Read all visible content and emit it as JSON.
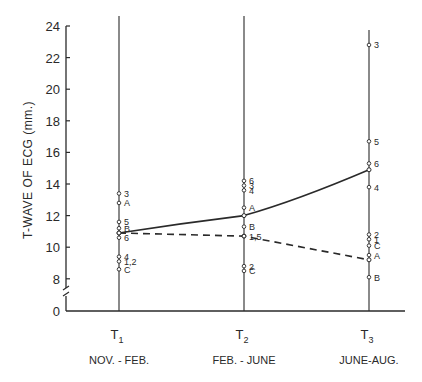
{
  "chart_data": {
    "type": "line",
    "title": "",
    "ylabel": "T-WAVE OF ECG (mm.)",
    "xlabel": "",
    "ylim": [
      0,
      24
    ],
    "y_axis_break": [
      0,
      8
    ],
    "yticks": [
      0,
      8,
      10,
      12,
      14,
      16,
      18,
      20,
      22,
      24
    ],
    "categories": [
      "T1",
      "T2",
      "T3"
    ],
    "category_subtitles": [
      "NOV. - FEB.",
      "FEB. - JUNE",
      "JUNE-AUG."
    ],
    "grid": false,
    "series": [
      {
        "name": "mean (solid)",
        "style": "solid",
        "values": [
          10.9,
          12.0,
          14.9
        ]
      },
      {
        "name": "mean (dashed)",
        "style": "dashed",
        "values": [
          10.9,
          10.7,
          9.2
        ]
      }
    ],
    "individual_points": [
      {
        "time": "T1",
        "points": [
          {
            "label": "3",
            "value": 13.4
          },
          {
            "label": "A",
            "value": 12.8
          },
          {
            "label": "5",
            "value": 11.6
          },
          {
            "label": "B",
            "value": 11.2
          },
          {
            "label": "6",
            "value": 10.6
          },
          {
            "label": "4",
            "value": 9.4
          },
          {
            "label": "1,2",
            "value": 9.1
          },
          {
            "label": "C",
            "value": 8.6
          }
        ]
      },
      {
        "time": "T2",
        "points": [
          {
            "label": "6",
            "value": 14.2
          },
          {
            "label": "3",
            "value": 13.9
          },
          {
            "label": "4",
            "value": 13.6
          },
          {
            "label": "A",
            "value": 12.5
          },
          {
            "label": "B",
            "value": 11.3
          },
          {
            "label": "1,5",
            "value": 10.7
          },
          {
            "label": "2",
            "value": 8.8
          },
          {
            "label": "C",
            "value": 8.5
          }
        ]
      },
      {
        "time": "T3",
        "points": [
          {
            "label": "3",
            "value": 22.8
          },
          {
            "label": "5",
            "value": 16.7
          },
          {
            "label": "6",
            "value": 15.3
          },
          {
            "label": "4",
            "value": 13.8
          },
          {
            "label": "2",
            "value": 10.8
          },
          {
            "label": "1",
            "value": 10.5
          },
          {
            "label": "C",
            "value": 10.1
          },
          {
            "label": "A",
            "value": 9.5
          },
          {
            "label": "B",
            "value": 8.1
          }
        ]
      }
    ]
  },
  "colors": {
    "ink": "#2a2a2a",
    "background": "#ffffff"
  }
}
